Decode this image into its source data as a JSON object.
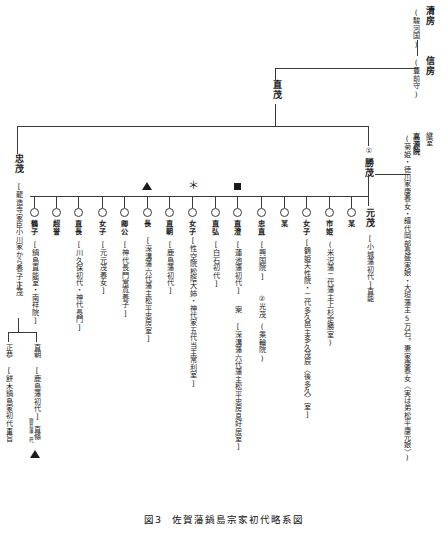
{
  "figure": {
    "caption_number": "図3",
    "caption_title": "佐賀藩鍋島宗家初代略系図"
  },
  "ancestors": {
    "kiyofusa": {
      "name": "清房",
      "note": "(駿河国)"
    },
    "nobufusa": {
      "name": "信房",
      "note": "(豊前守)"
    },
    "naoshige": {
      "name": "直茂"
    }
  },
  "head": {
    "katsushige": {
      "order": "①",
      "name": "勝茂"
    },
    "consort": {
      "title": "継室",
      "name": "高源院",
      "detail": "(菊姫・徳川家康養女・譜代岡部長盛実娘・大垣藩主5万石。妻家康養女〈実は弟松平康元娘〉)"
    }
  },
  "tadashige_branch": {
    "name": "忠茂",
    "note": "[龍造寺家臣小川家から養子]",
    "child": "正茂",
    "grandchildren": [
      {
        "name": "正恭",
        "note": "[餅木鍋島家初代]",
        "child": "直旨"
      },
      {
        "name": "直朝",
        "note": "[鹿島藩初代]",
        "child": "直條",
        "child_note": "鹿島藩二代"
      }
    ]
  },
  "children": [
    {
      "marker": "circle",
      "name": "鶴子",
      "note": "[鍋島直能室・南祥院]"
    },
    {
      "marker": "circle",
      "name": "超誉",
      "note": ""
    },
    {
      "marker": "circle",
      "name": "直長",
      "note": "[川久保初代・神代長門]"
    },
    {
      "marker": "circle",
      "name": "女子",
      "note": "[元元茂養女]"
    },
    {
      "marker": "circle",
      "name": "卿公",
      "note": "[神代長門常寛養子]"
    },
    {
      "marker": "circle",
      "name": "長",
      "note": "[深溝藩六代藩主松平忠房室]",
      "top_marker": "triangle"
    },
    {
      "marker": "circle",
      "name": "直朝",
      "note": "[鹿島藩初代]"
    },
    {
      "marker": "circle",
      "name": "女子",
      "note": "[性空院松陰大姉・神代家五代当主常利室]",
      "top_marker": "asterisk"
    },
    {
      "marker": "circle",
      "name": "直弘",
      "note": "[白石初代]"
    },
    {
      "marker": "circle",
      "name": "直澄",
      "note": "[蓮池藩初代]",
      "child": "案",
      "child_note": "[深溝藩六代藩主松平忠房息好房室]",
      "top_marker": "square"
    },
    {
      "marker": "circle",
      "name": "忠直",
      "note": "[興国院]",
      "child": "②光茂",
      "child_note": "(乘輪院)"
    },
    {
      "marker": "circle",
      "name": "某",
      "note": ""
    },
    {
      "marker": "circle",
      "name": "女子",
      "note": "[鶴姫天性院・二代多久邑主多久茂辰〈後多久〉室]"
    },
    {
      "marker": "circle",
      "name": "市姫",
      "note": "(米沢藩二代藩主上杉定勝室)"
    },
    {
      "marker": "circle",
      "name": "某",
      "note": ""
    },
    {
      "marker": "none",
      "name": "元茂",
      "note": "[小城藩初代]",
      "child": "直能"
    }
  ],
  "colors": {
    "line": "#3a3a3a",
    "text": "#1a1a1a",
    "background": "#ffffff"
  }
}
